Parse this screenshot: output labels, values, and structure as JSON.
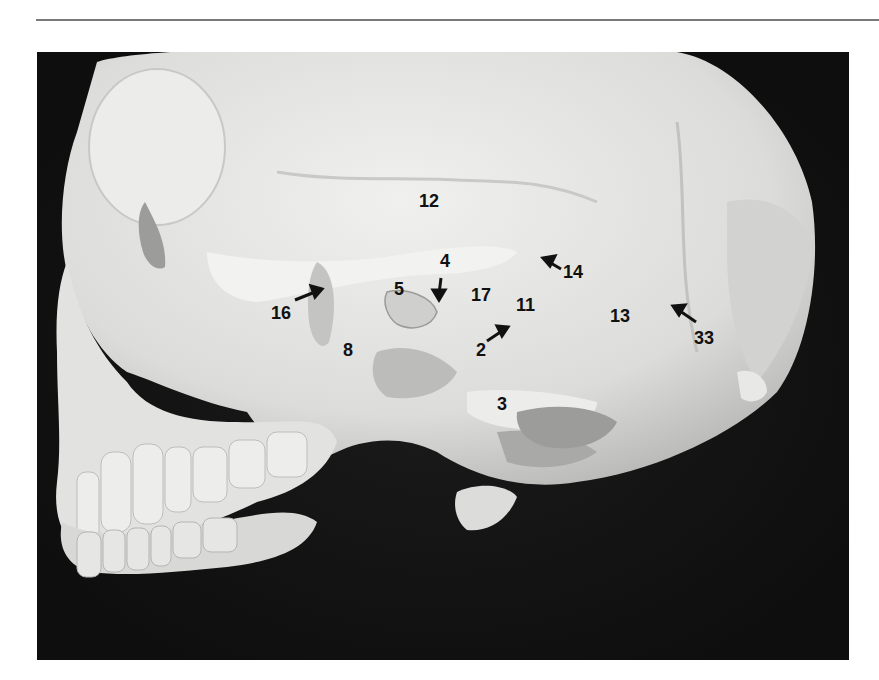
{
  "figure": {
    "background_color": "#141414",
    "bone_color": "#e4e4e2",
    "label_color": "#111111",
    "labels": [
      {
        "id": "12",
        "text": "12",
        "x": 419,
        "y": 192,
        "arrow": null
      },
      {
        "id": "4",
        "text": "4",
        "x": 440,
        "y": 252,
        "arrow": "down"
      },
      {
        "id": "14",
        "text": "14",
        "x": 563,
        "y": 263,
        "arrow": "up-left"
      },
      {
        "id": "5",
        "text": "5",
        "x": 394,
        "y": 280,
        "arrow": null
      },
      {
        "id": "17",
        "text": "17",
        "x": 471,
        "y": 286,
        "arrow": null
      },
      {
        "id": "11",
        "text": "11",
        "x": 516,
        "y": 296,
        "arrow": null
      },
      {
        "id": "16",
        "text": "16",
        "x": 271,
        "y": 304,
        "arrow": "up-right"
      },
      {
        "id": "13",
        "text": "13",
        "x": 610,
        "y": 307,
        "arrow": null
      },
      {
        "id": "33",
        "text": "33",
        "x": 694,
        "y": 329,
        "arrow": "up-left"
      },
      {
        "id": "2",
        "text": "2",
        "x": 476,
        "y": 341,
        "arrow": "up-right"
      },
      {
        "id": "8",
        "text": "8",
        "x": 343,
        "y": 341,
        "arrow": null
      },
      {
        "id": "3",
        "text": "3",
        "x": 497,
        "y": 395,
        "arrow": null
      }
    ]
  }
}
